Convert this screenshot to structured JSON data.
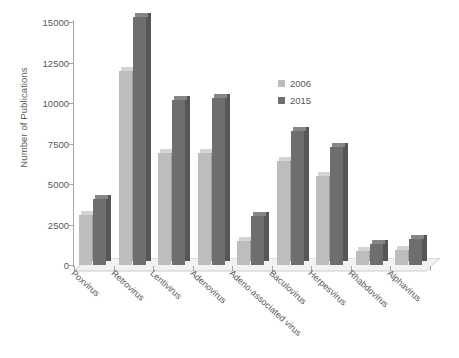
{
  "chart_data": {
    "type": "bar",
    "title": "",
    "xlabel": "",
    "ylabel": "Number of Publications",
    "ylim": [
      0,
      15000
    ],
    "ytick_values": [
      0,
      2500,
      5000,
      7500,
      10000,
      12500,
      15000
    ],
    "ytick_labels": [
      "0",
      "2500",
      "5000",
      "7500",
      "10000",
      "12500",
      "15000"
    ],
    "grid": false,
    "legend_position": "upper right",
    "categories": [
      "Poxvirus",
      "Retrovirus",
      "Lentivirus",
      "Adenovirus",
      "Adeno-associated virus",
      "Baculovirus",
      "Herpesvirus",
      "Rhabdovirus",
      "Alphavirus"
    ],
    "series": [
      {
        "name": "2006",
        "color": "#bdbdbd",
        "values": [
          3100,
          12000,
          6900,
          6900,
          1500,
          6400,
          5500,
          850,
          900
        ]
      },
      {
        "name": "2015",
        "color": "#6e6e6e",
        "values": [
          4100,
          15300,
          10200,
          10300,
          3050,
          8300,
          7300,
          1300,
          1600
        ]
      }
    ]
  },
  "legend": {
    "items": [
      {
        "label": "2006",
        "color": "#bdbdbd"
      },
      {
        "label": "2015",
        "color": "#6e6e6e"
      }
    ]
  },
  "colors": {
    "axis": "#a6a6a6",
    "text": "#595959",
    "background": "#ffffff",
    "floor_top": "#f2f2f2",
    "series_2006": "#bdbdbd",
    "series_2015": "#6e6e6e",
    "series_2006_side": "#9e9e9e",
    "series_2015_side": "#565656",
    "series_2006_top": "#d4d4d4",
    "series_2015_top": "#868686"
  }
}
